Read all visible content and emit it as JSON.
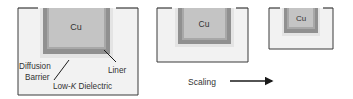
{
  "colors": {
    "dielectric": "#f2f2f2",
    "barrier": "#909090",
    "liner": "#a8a8a8",
    "cu": "#c4c4c4",
    "halo": "#e2e2e2",
    "outline": "#3a3a3a",
    "text": "#333333"
  },
  "structures": [
    {
      "cu_label": "Cu"
    },
    {
      "cu_label": "Cu"
    },
    {
      "cu_label": "Cu"
    }
  ],
  "labels": {
    "diffusion_line1": "Diffusion",
    "diffusion_line2": "Barrier",
    "liner": "Liner",
    "dielectric_prefix": "Low-",
    "dielectric_k": "K",
    "dielectric_suffix": " Dielectric"
  },
  "scaling": {
    "label": "Scaling"
  }
}
